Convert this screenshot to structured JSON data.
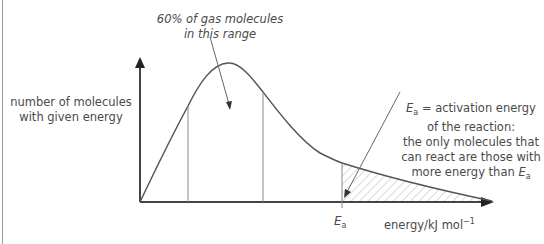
{
  "diagram": {
    "y_axis_label_line1": "number of molecules",
    "y_axis_label_line2": "with given energy",
    "x_axis_label": "energy/kJ mol",
    "x_axis_label_exp": "−1",
    "ea_tick_label": "E",
    "ea_tick_sub": "a",
    "annotation_range_line1": "60% of gas molecules",
    "annotation_range_line2": "in this range",
    "annotation_ea_line1_var": "E",
    "annotation_ea_line1_sub": "a",
    "annotation_ea_line1_rest": " = activation energy",
    "annotation_ea_line2": "of the reaction:",
    "annotation_ea_line3": "the only molecules that",
    "annotation_ea_line4": "can react are those with",
    "annotation_ea_line5_text": "more energy than ",
    "annotation_ea_line5_var": "E",
    "annotation_ea_line5_sub": "a",
    "colors": {
      "curve": "#555555",
      "axis": "#444444",
      "hatch": "#b0b0b0",
      "text": "#4a4a4a"
    }
  }
}
